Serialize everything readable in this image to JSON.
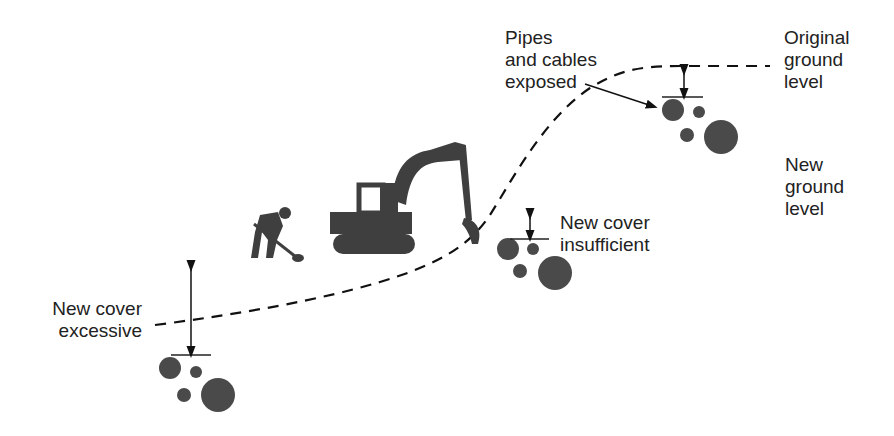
{
  "labels": {
    "pipes": [
      "Pipes",
      "and cables",
      "exposed"
    ],
    "original": [
      "Original",
      "ground",
      "level"
    ],
    "new_ground": [
      "New",
      "ground",
      "level"
    ],
    "insufficient": [
      "New cover",
      "insufficient"
    ],
    "excessive": [
      "New cover",
      "excessive"
    ]
  },
  "colors": {
    "ground_top": "#8c8c8c",
    "ground_bottom": "#ffffff",
    "pipe": "#4a4a4a",
    "machine": "#3f3f3f",
    "line": "#111111"
  }
}
